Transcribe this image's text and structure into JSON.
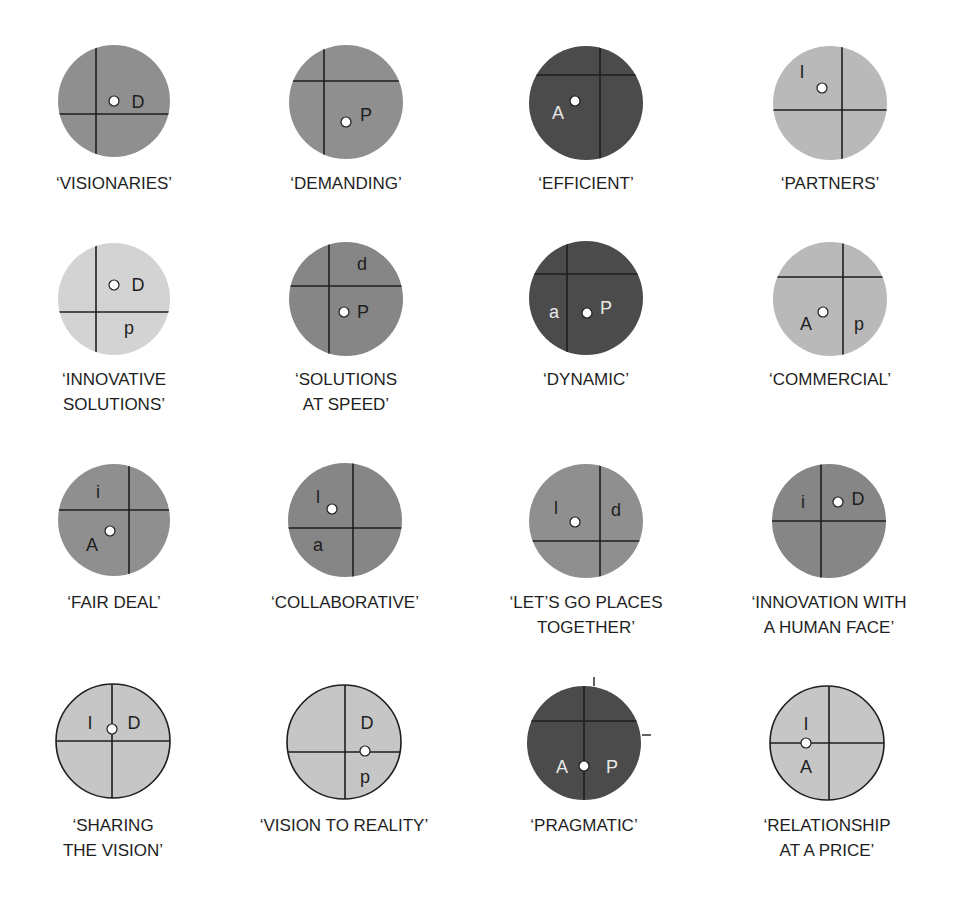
{
  "colors": {
    "dark": "#4b4b4b",
    "medium": "#8f8f8f",
    "medium_dark": "#868686",
    "light": "#d3d3d3",
    "light_medium": "#b9b9b9",
    "outlined_light": "#c6c6c6",
    "line": "#1e1e1e",
    "dot_fill": "#ffffff",
    "text": "#1e1e1e",
    "text_on_dark": "#e8e8e8"
  },
  "circles": [
    {
      "name": "visionaries",
      "label_lines": [
        "‘VISIONARIES’"
      ],
      "cx": 114,
      "cy": 101,
      "r": 56,
      "fill": "medium",
      "outline": false,
      "vline": 96,
      "hline": 114,
      "dot": [
        114,
        101
      ],
      "letters": [
        {
          "t": "D",
          "x": 138,
          "y": 108,
          "light": false
        }
      ],
      "label_y": [
        189
      ]
    },
    {
      "name": "demanding",
      "label_lines": [
        "‘DEMANDING’"
      ],
      "cx": 346,
      "cy": 102,
      "r": 57,
      "fill": "medium",
      "outline": false,
      "vline": 324,
      "hline": 81,
      "dot": [
        346,
        122
      ],
      "letters": [
        {
          "t": "P",
          "x": 366,
          "y": 121,
          "light": false
        }
      ],
      "label_y": [
        189
      ]
    },
    {
      "name": "efficient",
      "label_lines": [
        "‘EFFICIENT’"
      ],
      "cx": 586,
      "cy": 103,
      "r": 57,
      "fill": "dark",
      "outline": false,
      "vline": 600,
      "hline": 75,
      "dot": [
        575,
        101
      ],
      "letters": [
        {
          "t": "A",
          "x": 558,
          "y": 119,
          "light": true
        }
      ],
      "label_y": [
        189
      ]
    },
    {
      "name": "partners",
      "label_lines": [
        "‘PARTNERS’"
      ],
      "cx": 830,
      "cy": 103,
      "r": 57,
      "fill": "light_medium",
      "outline": false,
      "vline": 842,
      "hline": 110,
      "dot": [
        822,
        88
      ],
      "letters": [
        {
          "t": "I",
          "x": 802,
          "y": 78,
          "light": false
        }
      ],
      "label_y": [
        189
      ]
    },
    {
      "name": "innovative-solutions",
      "label_lines": [
        "‘INNOVATIVE",
        "SOLUTIONS’"
      ],
      "cx": 114,
      "cy": 299,
      "r": 56,
      "fill": "light",
      "outline": false,
      "vline": 96,
      "hline": 312,
      "dot": [
        114,
        285
      ],
      "letters": [
        {
          "t": "D",
          "x": 138,
          "y": 291,
          "light": false
        },
        {
          "t": "p",
          "x": 129,
          "y": 334,
          "light": false
        }
      ],
      "label_y": [
        385,
        410
      ]
    },
    {
      "name": "solutions-at-speed",
      "label_lines": [
        "‘SOLUTIONS",
        "AT SPEED’"
      ],
      "cx": 346,
      "cy": 299,
      "r": 57,
      "fill": "medium_dark",
      "outline": false,
      "vline": 329,
      "hline": 286,
      "dot": [
        344,
        312
      ],
      "letters": [
        {
          "t": "d",
          "x": 362,
          "y": 270,
          "light": false
        },
        {
          "t": "P",
          "x": 363,
          "y": 318,
          "light": false
        }
      ],
      "label_y": [
        385,
        410
      ]
    },
    {
      "name": "dynamic",
      "label_lines": [
        "‘DYNAMIC’"
      ],
      "cx": 586,
      "cy": 298,
      "r": 57,
      "fill": "dark",
      "outline": false,
      "vline": 567,
      "hline": 274,
      "dot": [
        587,
        313
      ],
      "letters": [
        {
          "t": "a",
          "x": 554,
          "y": 318,
          "light": true
        },
        {
          "t": "P",
          "x": 606,
          "y": 314,
          "light": true
        }
      ],
      "label_y": [
        385
      ]
    },
    {
      "name": "commercial",
      "label_lines": [
        "‘COMMERCIAL’"
      ],
      "cx": 830,
      "cy": 299,
      "r": 57,
      "fill": "light_medium",
      "outline": false,
      "vline": 843,
      "hline": 277,
      "dot": [
        823,
        312
      ],
      "letters": [
        {
          "t": "A",
          "x": 806,
          "y": 330,
          "light": false
        },
        {
          "t": "p",
          "x": 859,
          "y": 330,
          "light": false
        }
      ],
      "label_y": [
        385
      ]
    },
    {
      "name": "fair-deal",
      "label_lines": [
        "‘FAIR DEAL’"
      ],
      "cx": 114,
      "cy": 520,
      "r": 56,
      "fill": "medium",
      "outline": false,
      "vline": 129,
      "hline": 510,
      "dot": [
        110,
        531
      ],
      "letters": [
        {
          "t": "i",
          "x": 98,
          "y": 498,
          "light": false
        },
        {
          "t": "A",
          "x": 92,
          "y": 551,
          "light": false
        }
      ],
      "label_y": [
        608
      ]
    },
    {
      "name": "collaborative",
      "label_lines": [
        "‘COLLABORATIVE’"
      ],
      "cx": 345,
      "cy": 520,
      "r": 57,
      "fill": "medium_dark",
      "outline": false,
      "vline": 353,
      "hline": 528,
      "dot": [
        332,
        509
      ],
      "letters": [
        {
          "t": "l",
          "x": 318,
          "y": 503,
          "light": false
        },
        {
          "t": "a",
          "x": 318,
          "y": 551,
          "light": false
        }
      ],
      "label_y": [
        608
      ]
    },
    {
      "name": "lets-go-places-together",
      "label_lines": [
        "‘LET’S GO PLACES",
        "TOGETHER’"
      ],
      "cx": 586,
      "cy": 521,
      "r": 57,
      "fill": "medium",
      "outline": false,
      "vline": 600,
      "hline": 541,
      "dot": [
        575,
        522
      ],
      "letters": [
        {
          "t": "l",
          "x": 556,
          "y": 514,
          "light": false
        },
        {
          "t": "d",
          "x": 616,
          "y": 516,
          "light": false
        }
      ],
      "label_y": [
        608,
        633
      ]
    },
    {
      "name": "innovation-with-a-human-face",
      "label_lines": [
        "‘INNOVATION WITH",
        "A HUMAN FACE’"
      ],
      "cx": 829,
      "cy": 521,
      "r": 57,
      "fill": "medium_dark",
      "outline": false,
      "vline": 821,
      "hline": 521,
      "dot": [
        838,
        502
      ],
      "letters": [
        {
          "t": "i",
          "x": 803,
          "y": 508,
          "light": false
        },
        {
          "t": "D",
          "x": 858,
          "y": 505,
          "light": false
        }
      ],
      "label_y": [
        608,
        633
      ]
    },
    {
      "name": "sharing-the-vision",
      "label_lines": [
        "‘SHARING",
        "THE VISION’"
      ],
      "cx": 113,
      "cy": 741,
      "r": 57,
      "fill": "outlined_light",
      "outline": true,
      "vline": 112,
      "hline": 741,
      "dot": [
        112,
        729
      ],
      "letters": [
        {
          "t": "I",
          "x": 90,
          "y": 729,
          "light": false
        },
        {
          "t": "D",
          "x": 134,
          "y": 729,
          "light": false
        }
      ],
      "label_y": [
        831,
        856
      ]
    },
    {
      "name": "vision-to-reality",
      "label_lines": [
        "‘VISION TO REALITY’"
      ],
      "cx": 344,
      "cy": 742,
      "r": 57,
      "fill": "outlined_light",
      "outline": true,
      "vline": 345,
      "hline": 752,
      "dot": [
        365,
        751
      ],
      "letters": [
        {
          "t": "D",
          "x": 367,
          "y": 729,
          "light": false
        },
        {
          "t": "p",
          "x": 365,
          "y": 783,
          "light": false
        }
      ],
      "label_y": [
        831
      ]
    },
    {
      "name": "pragmatic",
      "label_lines": [
        "‘PRAGMATIC’"
      ],
      "cx": 584,
      "cy": 743,
      "r": 57,
      "fill": "dark",
      "outline": false,
      "vline": 584,
      "hline": 721,
      "dot": [
        584,
        766
      ],
      "letters": [
        {
          "t": "A",
          "x": 562,
          "y": 773,
          "light": true
        },
        {
          "t": "P",
          "x": 612,
          "y": 773,
          "light": true
        }
      ],
      "label_y": [
        831
      ],
      "ticks": [
        [
          594,
          677,
          594,
          686
        ],
        [
          642,
          735,
          651,
          735
        ]
      ]
    },
    {
      "name": "relationship-at-a-price",
      "label_lines": [
        "‘RELATIONSHIP",
        "AT A PRICE’"
      ],
      "cx": 827,
      "cy": 743,
      "r": 57,
      "fill": "outlined_light",
      "outline": true,
      "vline": 829,
      "hline": 743,
      "dot": [
        806,
        743
      ],
      "letters": [
        {
          "t": "I",
          "x": 806,
          "y": 730,
          "light": false
        },
        {
          "t": "A",
          "x": 806,
          "y": 773,
          "light": false
        }
      ],
      "label_y": [
        831,
        856
      ]
    }
  ]
}
